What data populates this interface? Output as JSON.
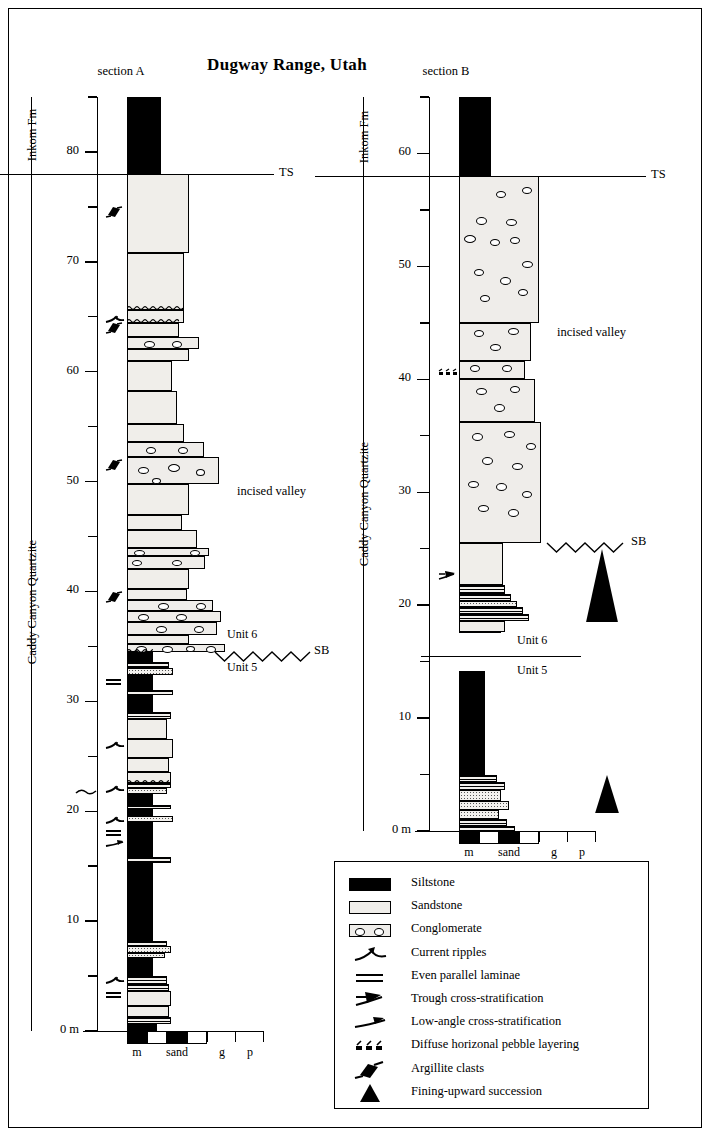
{
  "figure": {
    "title": "Dugway Range, Utah",
    "width_px": 712,
    "height_px": 1138
  },
  "sections": [
    {
      "id": "A",
      "caption": "section A",
      "axis": {
        "unit": "m",
        "zero_label": "0 m",
        "major_labels": [
          "80",
          "70",
          "60",
          "50",
          "40",
          "30",
          "20",
          "10",
          "0 m"
        ],
        "major_values": [
          80,
          70,
          60,
          50,
          40,
          30,
          20,
          10,
          0
        ],
        "minor_values": [
          85,
          75,
          65,
          55,
          45,
          35,
          25,
          15,
          5
        ],
        "min": 0,
        "max": 85
      },
      "formations": [
        {
          "name": "Inkom Fm",
          "top": 85,
          "base": 78
        },
        {
          "name": "Caddy Canyon Quartzite",
          "top": 78,
          "base": 0
        }
      ],
      "markers": [
        {
          "label": "TS",
          "value": 78,
          "style": "flat"
        },
        {
          "label": "SB",
          "value": 34.5,
          "style": "zigzag"
        }
      ],
      "unit_labels": [
        {
          "label": "Unit 6",
          "value": 36
        },
        {
          "label": "Unit 5",
          "value": 33
        }
      ],
      "annotations": [
        {
          "label": "incised valley",
          "value": 49
        }
      ],
      "structure_symbols": [
        {
          "symbol": "argillite-clasts",
          "value": 74.5
        },
        {
          "symbol": "argillite-clasts",
          "value": 64.0
        },
        {
          "symbol": "current-ripples",
          "value": 64.8
        },
        {
          "symbol": "argillite-clasts",
          "value": 51.5
        },
        {
          "symbol": "argillite-clasts",
          "value": 39.5
        },
        {
          "symbol": "even-parallel-laminae",
          "value": 31.8
        },
        {
          "symbol": "current-ripples",
          "value": 26.0
        },
        {
          "symbol": "current-ripples",
          "value": 22.0
        },
        {
          "symbol": "current-ripples",
          "value": 19.2
        },
        {
          "symbol": "even-parallel-laminae",
          "value": 18.0
        },
        {
          "symbol": "low-angle-cross-strat",
          "value": 17.0
        },
        {
          "symbol": "current-ripples",
          "value": 4.6
        },
        {
          "symbol": "even-parallel-laminae",
          "value": 3.3
        }
      ],
      "grain_scale": {
        "labels": [
          "m",
          "sand",
          "g",
          "p"
        ]
      }
    },
    {
      "id": "B",
      "caption": "section B",
      "axis": {
        "unit": "m",
        "zero_label": "0 m",
        "major_labels": [
          "60",
          "50",
          "40",
          "30",
          "20",
          "10",
          "0 m"
        ],
        "major_values": [
          60,
          50,
          40,
          30,
          20,
          10,
          0
        ],
        "minor_values": [
          65,
          55,
          45,
          35,
          25,
          15,
          5
        ],
        "min": 0,
        "max": 65
      },
      "formations": [
        {
          "name": "Inkom Fm",
          "top": 65,
          "base": 58
        },
        {
          "name": "Caddy Canyon Quartzite",
          "top": 58,
          "base": 0
        }
      ],
      "markers": [
        {
          "label": "TS",
          "value": 58,
          "style": "flat"
        },
        {
          "label": "SB",
          "value": 25.5,
          "style": "zigzag"
        }
      ],
      "unit_labels": [
        {
          "label": "Unit 6",
          "value": 16.8
        },
        {
          "label": "Unit 5",
          "value": 14.2
        }
      ],
      "annotations": [
        {
          "label": "incised valley",
          "value": 44
        }
      ],
      "structure_symbols": [
        {
          "symbol": "diffuse-pebble-layering",
          "value": 40.6
        },
        {
          "symbol": "trough-cross-strat",
          "value": 22.6
        }
      ],
      "fining_upward": [
        {
          "top": 25.0,
          "base": 18.5
        },
        {
          "top": 5.0,
          "base": 1.6
        }
      ],
      "grain_scale": {
        "labels": [
          "m",
          "sand",
          "g",
          "p"
        ]
      }
    }
  ],
  "legend": {
    "items": [
      {
        "symbol": "siltstone-swatch",
        "label": "Siltstone"
      },
      {
        "symbol": "sandstone-swatch",
        "label": "Sandstone"
      },
      {
        "symbol": "conglomerate-swatch",
        "label": "Conglomerate"
      },
      {
        "symbol": "current-ripples-icon",
        "label": "Current ripples"
      },
      {
        "symbol": "even-parallel-laminae-icon",
        "label": "Even parallel laminae"
      },
      {
        "symbol": "trough-cross-strat-icon",
        "label": "Trough cross-stratification"
      },
      {
        "symbol": "low-angle-cross-strat-icon",
        "label": "Low-angle cross-stratification"
      },
      {
        "symbol": "diffuse-pebble-icon",
        "label": "Diffuse horizonal pebble layering"
      },
      {
        "symbol": "argillite-clasts-icon",
        "label": "Argillite clasts"
      },
      {
        "symbol": "fining-upward-icon",
        "label": "Fining-upward succession"
      }
    ]
  },
  "colors": {
    "ink": "#000000",
    "siltstone": "#000000",
    "sandstone_fill": "#f0eeea",
    "paper": "#ffffff"
  }
}
